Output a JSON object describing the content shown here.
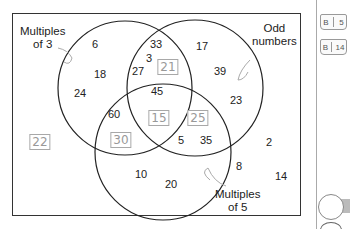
{
  "diagram": {
    "type": "venn-3-set",
    "sets": [
      {
        "label_line1": "Multiples",
        "label_line2": "of 3"
      },
      {
        "label_line1": "Odd",
        "label_line2": "numbers"
      },
      {
        "label_line1": "Multiples",
        "label_line2": "of 5"
      }
    ],
    "regions": {
      "only_multiples_of_3": [
        "6",
        "18",
        "24"
      ],
      "only_odd": [
        "17",
        "39",
        "23"
      ],
      "only_multiples_of_5": [
        "10",
        "20"
      ],
      "multiples_of_3_and_odd": [
        "33",
        "3",
        "27"
      ],
      "multiples_of_3_and_5": [
        "60"
      ],
      "odd_and_multiples_of_5": [
        "5",
        "35"
      ],
      "all_three": [
        "45"
      ],
      "outside": [
        "2",
        "8",
        "14"
      ]
    },
    "handwritten_answers": {
      "multiples_of_3_and_odd": "21",
      "multiples_of_3_and_5": "30",
      "all_three": "15",
      "odd_and_multiples_of_5": "25",
      "outside": "22"
    }
  },
  "sidebar": {
    "bookmarks": [
      {
        "letter": "B",
        "page": "5"
      },
      {
        "letter": "B",
        "page": "14"
      }
    ]
  }
}
